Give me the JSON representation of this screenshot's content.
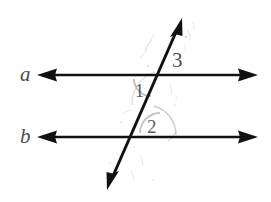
{
  "figure": {
    "background_color": "#ffffff",
    "line_color": "#1a1a1a",
    "label_color": "#4c4c4c",
    "arc_color": "#b9b9b9",
    "width": 271,
    "height": 202
  },
  "lines": {
    "line_a": {
      "label": "a",
      "orientation": "horizontal",
      "y": 75,
      "x_start": 37,
      "x_end": 258,
      "arrowheads": "both"
    },
    "line_b": {
      "label": "b",
      "orientation": "horizontal",
      "y": 137,
      "x_start": 37,
      "x_end": 258,
      "arrowheads": "both"
    },
    "transversal": {
      "label": "",
      "orientation": "oblique",
      "x_top": 182,
      "y_top": 18,
      "x_bottom": 107,
      "y_bottom": 190,
      "arrowheads": "both"
    }
  },
  "intersections": {
    "point_a": {
      "x": 157,
      "y": 75,
      "on_line": "a"
    },
    "point_b": {
      "x": 128,
      "y": 137,
      "on_line": "b"
    }
  },
  "angles": [
    {
      "id": "angle-1",
      "label": "1",
      "x": 141,
      "y": 92,
      "at_intersection": "point_a",
      "position": "below-left",
      "has_arc": true
    },
    {
      "id": "angle-2",
      "label": "2",
      "x": 155,
      "y": 128,
      "at_intersection": "point_b",
      "position": "above-right",
      "has_arc": true
    },
    {
      "id": "angle-3",
      "label": "3",
      "x": 180,
      "y": 62,
      "at_intersection": "point_a",
      "position": "above-right",
      "has_arc": false
    }
  ]
}
